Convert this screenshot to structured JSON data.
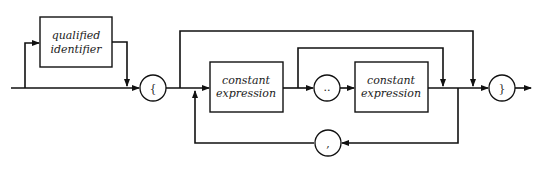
{
  "diagram": {
    "type": "syntax-diagram",
    "nodes": {
      "qualified_identifier": {
        "line1": "qualified",
        "line2": "identifier",
        "kind": "nonterminal"
      },
      "open_brace": {
        "symbol": "{",
        "kind": "terminal"
      },
      "const_expr_1": {
        "line1": "constant",
        "line2": "expression",
        "kind": "nonterminal"
      },
      "range_dots": {
        "symbol": "..",
        "kind": "terminal"
      },
      "const_expr_2": {
        "line1": "constant",
        "line2": "expression",
        "kind": "nonterminal"
      },
      "comma": {
        "symbol": ",",
        "kind": "terminal"
      },
      "close_brace": {
        "symbol": "}",
        "kind": "terminal"
      }
    },
    "colors": {
      "stroke": "#111111",
      "background": "#ffffff",
      "text": "#222222"
    }
  }
}
